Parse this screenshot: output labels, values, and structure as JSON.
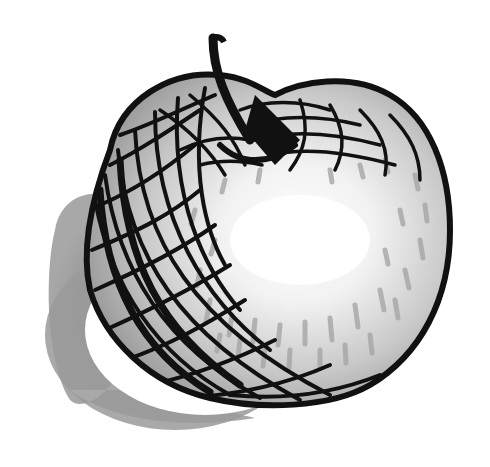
{
  "image": {
    "subject": "apple",
    "style": "pen-and-ink crosshatched drawing",
    "colors": {
      "background": "#ffffff",
      "ink": "#111111",
      "shadow": "#8c8c8c",
      "mid_gray": "#b5b5b5",
      "light_gray": "#d9d9d9",
      "highlight": "#ffffff"
    }
  }
}
